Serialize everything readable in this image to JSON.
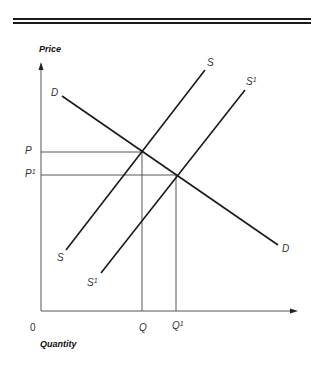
{
  "diagram": {
    "type": "supply-demand",
    "y_axis_title": "Price",
    "x_axis_title": "Quantity",
    "origin_label": "0",
    "curves": [
      {
        "id": "D",
        "label": "D",
        "kind": "demand"
      },
      {
        "id": "S",
        "label": "S",
        "kind": "supply"
      },
      {
        "id": "S1",
        "label": "S",
        "superscript": "1",
        "kind": "supply-shifted"
      }
    ],
    "price_labels": {
      "P": {
        "text": "P",
        "superscript": ""
      },
      "P1": {
        "text": "P",
        "superscript": "1"
      }
    },
    "quantity_labels": {
      "Q": {
        "text": "Q",
        "superscript": ""
      },
      "Q1": {
        "text": "Q",
        "superscript": "1"
      }
    },
    "equilibria": [
      {
        "curves": [
          "D",
          "S"
        ],
        "price": "P",
        "quantity": "Q"
      },
      {
        "curves": [
          "D",
          "S1"
        ],
        "price": "P1",
        "quantity": "Q1"
      }
    ],
    "colors": {
      "line": "#1a1a1a",
      "axis": "#555555",
      "guide": "#444444"
    }
  }
}
